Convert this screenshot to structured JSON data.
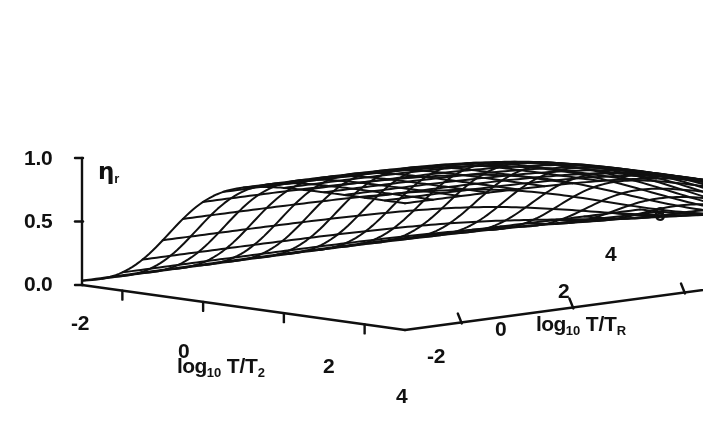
{
  "figure": {
    "kind": "3d-surface-wireframe",
    "background_color": "#ffffff",
    "line_color": "#101010",
    "axis_color": "#101010"
  },
  "zaxis": {
    "title": "η",
    "title_sub": "r",
    "ticks": [
      "1.0",
      "0.5",
      "0.0"
    ],
    "tick_values": [
      1.0,
      0.5,
      0.0
    ],
    "range": [
      0.0,
      1.0
    ]
  },
  "xaxis": {
    "title_lead": "log",
    "title_sub10": "10",
    "title_rest": " T/T",
    "title_sub": "2",
    "ticks": [
      "-2",
      "0",
      "2",
      "4"
    ],
    "tick_values": [
      -2,
      0,
      2,
      4
    ],
    "range": [
      -3,
      5
    ]
  },
  "yaxis": {
    "title_lead": "log",
    "title_sub10": "10",
    "title_rest": " T/T",
    "title_sub": "R",
    "ticks": [
      "-2",
      "0",
      "2",
      "4",
      "6"
    ],
    "tick_values": [
      -2,
      0,
      2,
      4,
      6
    ],
    "range": [
      -3,
      7
    ]
  },
  "chart_data": {
    "type": "surface",
    "title": "",
    "xlabel": "log10 T/T2",
    "ylabel": "log10 T/TR",
    "zlabel": "eta_r",
    "xlim": [
      -3,
      5
    ],
    "ylim": [
      -3,
      7
    ],
    "zlim": [
      0,
      1
    ],
    "grid": false,
    "legend": "none",
    "x_tick_labels": [
      "-2",
      "0",
      "2",
      "4"
    ],
    "y_tick_labels": [
      "-2",
      "0",
      "2",
      "4",
      "6"
    ],
    "z_tick_labels": [
      "0.0",
      "0.5",
      "1.0"
    ],
    "mesh": {
      "nx": 17,
      "ny": 21
    },
    "model": {
      "description": "eta_r = sigmoid rise in log10 T/T2 multiplied by sigmoid fall in log10 T/TR",
      "x_midpoint": -0.85,
      "x_steepness": 1.55,
      "y_midpoint": 4.6,
      "y_steepness": 0.82,
      "plateau_value": 1.0,
      "floor_value": 0.0
    },
    "x": [
      -3,
      -2.5,
      -2,
      -1.5,
      -1,
      -0.5,
      0,
      0.5,
      1,
      1.5,
      2,
      2.5,
      3,
      3.5,
      4,
      4.5,
      5
    ],
    "y": [
      -3,
      -2.5,
      -2,
      -1.5,
      -1,
      -0.5,
      0,
      0.5,
      1,
      1.5,
      2,
      2.5,
      3,
      3.5,
      4,
      4.5,
      5,
      5.5,
      6,
      6.5,
      7
    ],
    "z_rows": [
      [
        0.03,
        0.07,
        0.14,
        0.27,
        0.46,
        0.66,
        0.82,
        0.91,
        0.96,
        0.98,
        0.99,
        1.0,
        1.0,
        1.0,
        1.0,
        1.0,
        1.0
      ],
      [
        0.03,
        0.07,
        0.14,
        0.27,
        0.46,
        0.66,
        0.82,
        0.91,
        0.96,
        0.98,
        0.99,
        1.0,
        1.0,
        1.0,
        1.0,
        1.0,
        1.0
      ],
      [
        0.03,
        0.07,
        0.14,
        0.27,
        0.46,
        0.66,
        0.82,
        0.91,
        0.96,
        0.98,
        0.99,
        1.0,
        1.0,
        1.0,
        1.0,
        1.0,
        1.0
      ],
      [
        0.03,
        0.07,
        0.14,
        0.27,
        0.46,
        0.66,
        0.82,
        0.91,
        0.96,
        0.98,
        0.99,
        1.0,
        1.0,
        1.0,
        1.0,
        1.0,
        1.0
      ],
      [
        0.03,
        0.07,
        0.14,
        0.27,
        0.46,
        0.66,
        0.82,
        0.91,
        0.96,
        0.98,
        0.99,
        1.0,
        1.0,
        1.0,
        1.0,
        1.0,
        1.0
      ],
      [
        0.03,
        0.07,
        0.14,
        0.27,
        0.46,
        0.66,
        0.82,
        0.91,
        0.96,
        0.98,
        0.99,
        0.99,
        1.0,
        1.0,
        1.0,
        1.0,
        1.0
      ],
      [
        0.03,
        0.07,
        0.14,
        0.27,
        0.45,
        0.65,
        0.81,
        0.9,
        0.95,
        0.97,
        0.98,
        0.99,
        0.99,
        0.99,
        0.99,
        0.99,
        0.99
      ],
      [
        0.03,
        0.07,
        0.13,
        0.26,
        0.44,
        0.64,
        0.8,
        0.89,
        0.94,
        0.96,
        0.97,
        0.98,
        0.98,
        0.98,
        0.98,
        0.98,
        0.98
      ],
      [
        0.03,
        0.06,
        0.13,
        0.26,
        0.43,
        0.63,
        0.78,
        0.87,
        0.92,
        0.94,
        0.95,
        0.96,
        0.96,
        0.96,
        0.96,
        0.96,
        0.96
      ],
      [
        0.03,
        0.06,
        0.12,
        0.25,
        0.42,
        0.61,
        0.76,
        0.84,
        0.89,
        0.91,
        0.92,
        0.93,
        0.93,
        0.93,
        0.93,
        0.93,
        0.93
      ],
      [
        0.03,
        0.06,
        0.12,
        0.23,
        0.39,
        0.57,
        0.71,
        0.79,
        0.83,
        0.85,
        0.86,
        0.87,
        0.87,
        0.87,
        0.87,
        0.87,
        0.87
      ],
      [
        0.02,
        0.05,
        0.11,
        0.21,
        0.36,
        0.52,
        0.64,
        0.72,
        0.76,
        0.78,
        0.79,
        0.79,
        0.79,
        0.79,
        0.8,
        0.8,
        0.8
      ],
      [
        0.02,
        0.05,
        0.1,
        0.19,
        0.32,
        0.45,
        0.56,
        0.63,
        0.66,
        0.68,
        0.69,
        0.69,
        0.69,
        0.69,
        0.7,
        0.7,
        0.7
      ],
      [
        0.02,
        0.04,
        0.08,
        0.16,
        0.26,
        0.38,
        0.47,
        0.52,
        0.55,
        0.57,
        0.57,
        0.58,
        0.58,
        0.58,
        0.58,
        0.58,
        0.58
      ],
      [
        0.01,
        0.03,
        0.07,
        0.13,
        0.21,
        0.3,
        0.37,
        0.41,
        0.44,
        0.45,
        0.45,
        0.46,
        0.46,
        0.46,
        0.46,
        0.46,
        0.46
      ],
      [
        0.01,
        0.02,
        0.05,
        0.1,
        0.16,
        0.23,
        0.28,
        0.31,
        0.33,
        0.34,
        0.34,
        0.35,
        0.35,
        0.35,
        0.35,
        0.35,
        0.35
      ],
      [
        0.01,
        0.02,
        0.04,
        0.07,
        0.11,
        0.16,
        0.2,
        0.22,
        0.24,
        0.24,
        0.25,
        0.25,
        0.25,
        0.25,
        0.25,
        0.25,
        0.25
      ],
      [
        0.0,
        0.01,
        0.02,
        0.05,
        0.08,
        0.11,
        0.14,
        0.15,
        0.16,
        0.17,
        0.17,
        0.17,
        0.17,
        0.17,
        0.17,
        0.17,
        0.17
      ],
      [
        0.0,
        0.01,
        0.02,
        0.03,
        0.05,
        0.07,
        0.09,
        0.1,
        0.11,
        0.11,
        0.11,
        0.11,
        0.11,
        0.11,
        0.11,
        0.11,
        0.11
      ],
      [
        0.0,
        0.0,
        0.01,
        0.02,
        0.03,
        0.05,
        0.06,
        0.07,
        0.07,
        0.07,
        0.07,
        0.07,
        0.07,
        0.07,
        0.07,
        0.07,
        0.07
      ],
      [
        0.0,
        0.0,
        0.01,
        0.01,
        0.02,
        0.03,
        0.04,
        0.04,
        0.04,
        0.05,
        0.05,
        0.05,
        0.05,
        0.05,
        0.05,
        0.05,
        0.05
      ]
    ]
  },
  "geometry": {
    "origin": {
      "x": 82,
      "y": 285
    },
    "z_top": {
      "x": 82,
      "y": 158
    },
    "x_axis_end": {
      "x": 405,
      "y": 330
    },
    "y_axis_end": {
      "x": 640,
      "y": 210
    },
    "z_scale_px": 127,
    "line_width": 2.0,
    "axis_line_width": 2.4
  },
  "labels": {
    "z_ticks": [
      {
        "text": "1.0",
        "x": 24,
        "y": 147
      },
      {
        "text": "0.5",
        "x": 24,
        "y": 210
      },
      {
        "text": "0.0",
        "x": 24,
        "y": 273
      }
    ],
    "z_title": {
      "x": 98,
      "y": 160
    },
    "x_ticks": [
      {
        "text": "-2",
        "x": 71,
        "y": 312
      },
      {
        "text": "0",
        "x": 178,
        "y": 340
      },
      {
        "text": "2",
        "x": 323,
        "y": 355
      },
      {
        "text": "4",
        "x": 396,
        "y": 385
      }
    ],
    "x_title": {
      "x": 177,
      "y": 355
    },
    "y_ticks": [
      {
        "text": "-2",
        "x": 427,
        "y": 345
      },
      {
        "text": "0",
        "x": 495,
        "y": 318
      },
      {
        "text": "2",
        "x": 558,
        "y": 280
      },
      {
        "text": "4",
        "x": 605,
        "y": 243
      },
      {
        "text": "6",
        "x": 654,
        "y": 203
      }
    ],
    "y_title": {
      "x": 536,
      "y": 313
    }
  }
}
